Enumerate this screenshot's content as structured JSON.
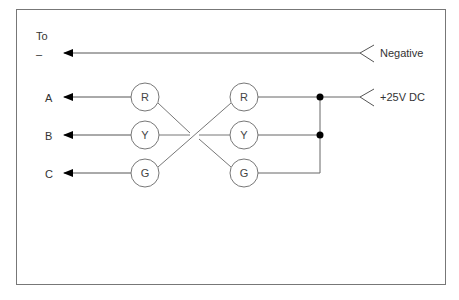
{
  "diagram": {
    "header_label": "To",
    "minus_label": "–",
    "rows": [
      {
        "output": "A",
        "left_lamp": "R",
        "right_lamp": "R"
      },
      {
        "output": "B",
        "left_lamp": "Y",
        "right_lamp": "Y"
      },
      {
        "output": "C",
        "left_lamp": "G",
        "right_lamp": "G"
      }
    ],
    "terminals": {
      "negative": "Negative",
      "positive": "+25V DC"
    }
  }
}
